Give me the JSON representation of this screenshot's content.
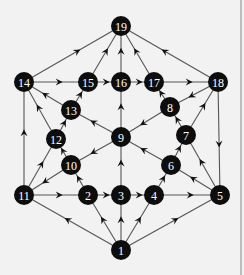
{
  "diagram": {
    "type": "directed-graph",
    "node_radius": 10,
    "colors": {
      "node_fill": "#0d0d0d",
      "node_text": "#ffffff",
      "edge": "#555555",
      "background": "#f2f2f2"
    },
    "nodes": [
      {
        "id": "1",
        "label": "1",
        "x": 121,
        "y": 250
      },
      {
        "id": "2",
        "label": "2",
        "x": 88,
        "y": 195
      },
      {
        "id": "3",
        "label": "3",
        "x": 121,
        "y": 195
      },
      {
        "id": "4",
        "label": "4",
        "x": 154,
        "y": 195
      },
      {
        "id": "5",
        "label": "5",
        "x": 220,
        "y": 195
      },
      {
        "id": "6",
        "label": "6",
        "x": 171,
        "y": 165
      },
      {
        "id": "7",
        "label": "7",
        "x": 186,
        "y": 135
      },
      {
        "id": "8",
        "label": "8",
        "x": 170,
        "y": 107
      },
      {
        "id": "9",
        "label": "9",
        "x": 121,
        "y": 137
      },
      {
        "id": "10",
        "label": "10",
        "x": 71,
        "y": 165
      },
      {
        "id": "11",
        "label": "11",
        "x": 24,
        "y": 195
      },
      {
        "id": "12",
        "label": "12",
        "x": 56,
        "y": 139
      },
      {
        "id": "13",
        "label": "13",
        "x": 71,
        "y": 110
      },
      {
        "id": "14",
        "label": "14",
        "x": 24,
        "y": 82
      },
      {
        "id": "15",
        "label": "15",
        "x": 88,
        "y": 82
      },
      {
        "id": "16",
        "label": "16",
        "x": 121,
        "y": 82
      },
      {
        "id": "17",
        "label": "17",
        "x": 154,
        "y": 82
      },
      {
        "id": "18",
        "label": "18",
        "x": 218,
        "y": 82
      },
      {
        "id": "19",
        "label": "19",
        "x": 121,
        "y": 26
      }
    ],
    "edges": [
      {
        "from": "14",
        "to": "19"
      },
      {
        "from": "15",
        "to": "19"
      },
      {
        "from": "16",
        "to": "19"
      },
      {
        "from": "17",
        "to": "19"
      },
      {
        "from": "18",
        "to": "19"
      },
      {
        "from": "14",
        "to": "15"
      },
      {
        "from": "15",
        "to": "16"
      },
      {
        "from": "16",
        "to": "17"
      },
      {
        "from": "17",
        "to": "18"
      },
      {
        "from": "13",
        "to": "14"
      },
      {
        "from": "13",
        "to": "15"
      },
      {
        "from": "12",
        "to": "14"
      },
      {
        "from": "12",
        "to": "13"
      },
      {
        "from": "9",
        "to": "13"
      },
      {
        "from": "9",
        "to": "16"
      },
      {
        "from": "8",
        "to": "17"
      },
      {
        "from": "18",
        "to": "8"
      },
      {
        "from": "8",
        "to": "9"
      },
      {
        "from": "7",
        "to": "8"
      },
      {
        "from": "7",
        "to": "18"
      },
      {
        "from": "18",
        "to": "5"
      },
      {
        "from": "11",
        "to": "14"
      },
      {
        "from": "11",
        "to": "12"
      },
      {
        "from": "10",
        "to": "12"
      },
      {
        "from": "10",
        "to": "11"
      },
      {
        "from": "9",
        "to": "10"
      },
      {
        "from": "2",
        "to": "10"
      },
      {
        "from": "11",
        "to": "2"
      },
      {
        "from": "2",
        "to": "3"
      },
      {
        "from": "3",
        "to": "4"
      },
      {
        "from": "4",
        "to": "5"
      },
      {
        "from": "3",
        "to": "9"
      },
      {
        "from": "6",
        "to": "9"
      },
      {
        "from": "6",
        "to": "7"
      },
      {
        "from": "4",
        "to": "6"
      },
      {
        "from": "5",
        "to": "6"
      },
      {
        "from": "5",
        "to": "7"
      },
      {
        "from": "1",
        "to": "11"
      },
      {
        "from": "1",
        "to": "2"
      },
      {
        "from": "1",
        "to": "3"
      },
      {
        "from": "1",
        "to": "4"
      },
      {
        "from": "1",
        "to": "5"
      }
    ]
  }
}
